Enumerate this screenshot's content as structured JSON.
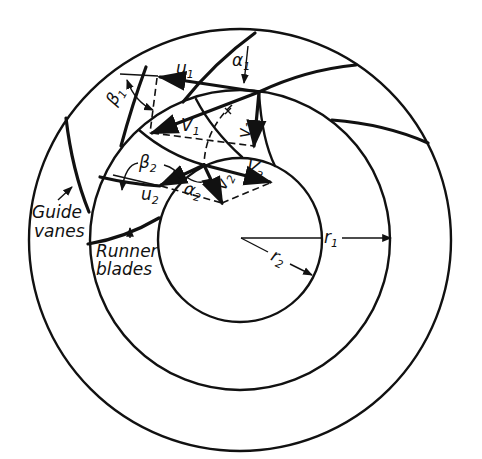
{
  "figure": {
    "type": "turbine runner velocity diagram",
    "colors": {
      "ink": "#111111",
      "background": "#ffffff"
    }
  },
  "labels": {
    "u1": {
      "main": "u",
      "sub": "1"
    },
    "alpha1": {
      "main": "α",
      "sub": "1"
    },
    "beta1": {
      "main": "β",
      "sub": "1"
    },
    "V1": {
      "main": "V",
      "sub": "1"
    },
    "v1": {
      "main": "v",
      "sub": "1"
    },
    "beta2": {
      "main": "β",
      "sub": "2"
    },
    "V2": {
      "main": "V",
      "sub": "2"
    },
    "u2": {
      "main": "u",
      "sub": "2"
    },
    "alpha2": {
      "main": "α",
      "sub": "2"
    },
    "v2": {
      "main": "v",
      "sub": "2"
    },
    "r1": {
      "main": "r",
      "sub": "1"
    },
    "r2": {
      "main": "r",
      "sub": "2"
    }
  },
  "annotations": {
    "guide_vanes_line1": "Guide",
    "guide_vanes_line2": "vanes",
    "runner_blades_line1": "Runner",
    "runner_blades_line2": "blades"
  }
}
